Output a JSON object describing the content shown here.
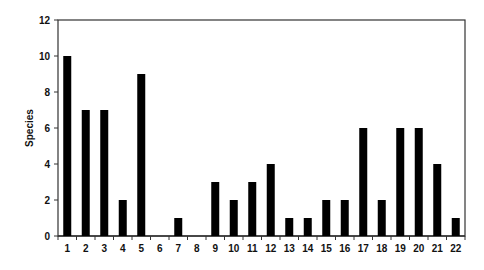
{
  "chart_data": {
    "type": "bar",
    "title": "",
    "xlabel": "",
    "ylabel": "Species",
    "categories": [
      "1",
      "2",
      "3",
      "4",
      "5",
      "6",
      "7",
      "8",
      "9",
      "10",
      "11",
      "12",
      "13",
      "14",
      "15",
      "16",
      "17",
      "18",
      "19",
      "20",
      "21",
      "22"
    ],
    "values": [
      10,
      7,
      7,
      2,
      9,
      0,
      1,
      0,
      3,
      2,
      3,
      4,
      1,
      1,
      2,
      2,
      6,
      2,
      6,
      6,
      4,
      1
    ],
    "ylim": [
      0,
      12
    ],
    "yticks": [
      0,
      2,
      4,
      6,
      8,
      10,
      12
    ],
    "grid": false,
    "legend": null,
    "bar_color": "#000000",
    "frame": "box"
  }
}
